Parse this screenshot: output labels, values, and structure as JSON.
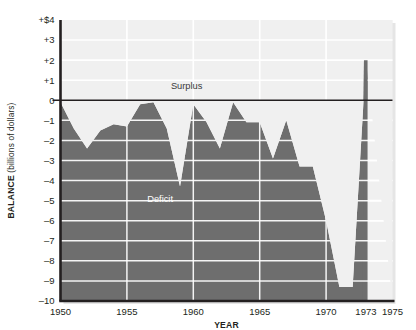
{
  "chart_data": {
    "type": "area",
    "title": "",
    "xlabel": "YEAR",
    "ylabel_bold": "BALANCE",
    "ylabel_sub": " (billions of dollars)",
    "xlim": [
      1950,
      1975
    ],
    "ylim": [
      -10,
      4
    ],
    "grid": true,
    "legend_position": "none",
    "y_ticks": [
      "+$4",
      "+3",
      "+2",
      "+1",
      "0",
      "–1",
      "–2",
      "–3",
      "–4",
      "–5",
      "–6",
      "–7",
      "–8",
      "–9",
      "–10"
    ],
    "y_tick_values": [
      4,
      3,
      2,
      1,
      0,
      -1,
      -2,
      -3,
      -4,
      -5,
      -6,
      -7,
      -8,
      -9,
      -10
    ],
    "x_ticks": [
      "1950",
      "1955",
      "1960",
      "1965",
      "1970",
      "1973",
      "1975"
    ],
    "x_tick_values": [
      1950,
      1955,
      1960,
      1965,
      1970,
      1973,
      1975
    ],
    "annotations": [
      {
        "text": "Surplus",
        "x": 1959.5,
        "y": 0.55
      },
      {
        "text": "Deficit",
        "x": 1957.5,
        "y": -5.05
      }
    ],
    "series": [
      {
        "name": "Federal budget balance",
        "x": [
          1950,
          1951,
          1952,
          1953,
          1954,
          1955,
          1956,
          1957,
          1958,
          1959,
          1960,
          1961,
          1962,
          1963,
          1964,
          1965,
          1966,
          1967,
          1968,
          1969,
          1970,
          1971,
          1972,
          1973
        ],
        "values": [
          -0.1,
          -1.4,
          -2.4,
          -1.5,
          -1.2,
          -1.3,
          -0.2,
          -0.1,
          -1.4,
          -4.3,
          -0.2,
          -1.1,
          -2.4,
          -0.1,
          -1.1,
          -1.1,
          -2.9,
          -1.0,
          -3.3,
          -3.3,
          -6.0,
          -9.3,
          -9.3,
          2.0
        ]
      }
    ],
    "colors": {
      "area_fill": "#6e6e6e",
      "plot_background": "#f0f0f0",
      "gridline": "#ffffff",
      "axis_line": "#231f20",
      "page_background": "#ffffff"
    }
  }
}
